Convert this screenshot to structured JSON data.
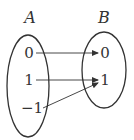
{
  "diagram": {
    "type": "mapping",
    "sets": [
      {
        "id": "A",
        "label": "A",
        "elements": [
          "0",
          "1",
          "−1"
        ]
      },
      {
        "id": "B",
        "label": "B",
        "elements": [
          "0",
          "1"
        ]
      }
    ],
    "mappings": [
      {
        "from": "0",
        "to": "0"
      },
      {
        "from": "1",
        "to": "1"
      },
      {
        "from": "−1",
        "to": "1"
      }
    ],
    "colors": {
      "stroke": "#333333",
      "text": "#333333",
      "background": "#ffffff"
    }
  }
}
